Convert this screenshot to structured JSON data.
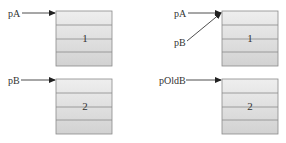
{
  "left_panel": {
    "top": {
      "pointer_label": "pA",
      "block_label": "1"
    },
    "bottom": {
      "pointer_label": "pB",
      "block_label": "2"
    }
  },
  "right_panel": {
    "top": {
      "pointer_labels": [
        "pA",
        "pB"
      ],
      "block_label": "1"
    },
    "bottom": {
      "pointer_label": "pOldB",
      "block_label": "2"
    }
  },
  "colors": {
    "block_fill_top": "#eeeeee",
    "block_fill_bottom": "#d4d4d4",
    "block_border": "#8a8a8a",
    "arrow": "#222222",
    "text": "#333333"
  }
}
